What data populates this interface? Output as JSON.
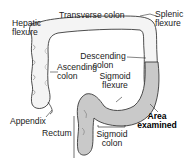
{
  "diagram": {
    "colors": {
      "outline": "#3a3a3a",
      "colon_fill": "#f4f4f4",
      "examined_fill": "#c9c9c9",
      "leader": "#333333",
      "text": "#1a1a1a"
    },
    "labels": {
      "hepatic_flexure": [
        "Hepatic",
        "flexure"
      ],
      "transverse_colon": "Transverse colon",
      "splenic_flexure": [
        "Splenic",
        "flexure"
      ],
      "ascending_colon": [
        "Ascending",
        "colon"
      ],
      "descending_colon": [
        "Descending",
        "colon"
      ],
      "sigmoid_flexure": [
        "Sigmoid",
        "flexure"
      ],
      "area_examined": [
        "Area",
        "examined"
      ],
      "appendix": "Appendix",
      "rectum": "Rectum",
      "sigmoid_colon": [
        "Sigmoid",
        "colon"
      ]
    }
  }
}
